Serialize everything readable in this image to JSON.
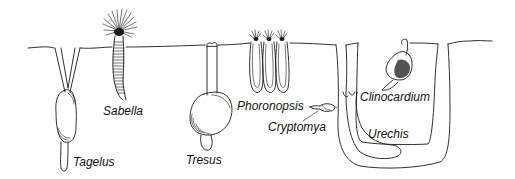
{
  "figure": {
    "colors": {
      "line": "#1a1a1a",
      "background": "#ffffff"
    },
    "organisms": [
      {
        "id": "tagelus",
        "label": "Tagelus"
      },
      {
        "id": "sabella",
        "label": "Sabella"
      },
      {
        "id": "tresus",
        "label": "Tresus"
      },
      {
        "id": "phoronopsis",
        "label": "Phoronopsis"
      },
      {
        "id": "cryptomya",
        "label": "Cryptomya"
      },
      {
        "id": "clinocardium",
        "label": "Clinocardium"
      },
      {
        "id": "urechis",
        "label": "Urechis"
      }
    ]
  }
}
